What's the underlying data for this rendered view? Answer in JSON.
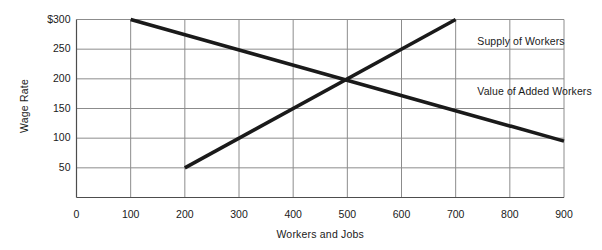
{
  "chart_data": {
    "type": "line",
    "title": "",
    "xlabel": "Workers and Jobs",
    "ylabel": "Wage Rate",
    "xlim": [
      0,
      900
    ],
    "ylim": [
      0,
      300
    ],
    "grid": true,
    "legend_position": "inline-right",
    "x_ticks": [
      0,
      100,
      200,
      300,
      400,
      500,
      600,
      700,
      800,
      900
    ],
    "x_tick_labels": [
      "0",
      "100",
      "200",
      "300",
      "400",
      "500",
      "600",
      "700",
      "800",
      "900"
    ],
    "y_ticks": [
      50,
      100,
      150,
      200,
      250,
      300
    ],
    "y_tick_labels": [
      "50",
      "100",
      "150",
      "200",
      "250",
      "$300"
    ],
    "series": [
      {
        "name": "Supply of Workers",
        "points": [
          [
            200,
            50
          ],
          [
            700,
            300
          ]
        ],
        "color": "#1a1a1a",
        "width": 3.6
      },
      {
        "name": "Value of Added Workers",
        "points": [
          [
            100,
            300
          ],
          [
            900,
            95
          ]
        ],
        "color": "#1a1a1a",
        "width": 3.6
      }
    ],
    "annotations": [
      {
        "text": "Supply of Workers",
        "x": 740,
        "y": 262
      },
      {
        "text": "Value of Added Workers",
        "x": 740,
        "y": 178
      }
    ],
    "equilibrium": {
      "x": 500,
      "y": 200
    },
    "grid_color": "#8c8c8c",
    "axis_color": "#4d4d4d"
  },
  "axes": {
    "y_title": "Wage Rate",
    "x_title": "Workers and Jobs"
  },
  "ticks": {
    "y": [
      {
        "label": "$300",
        "value": 300
      },
      {
        "label": "250",
        "value": 250
      },
      {
        "label": "200",
        "value": 200
      },
      {
        "label": "150",
        "value": 150
      },
      {
        "label": "100",
        "value": 100
      },
      {
        "label": "50",
        "value": 50
      }
    ],
    "x": [
      {
        "label": "0",
        "value": 0
      },
      {
        "label": "100",
        "value": 100
      },
      {
        "label": "200",
        "value": 200
      },
      {
        "label": "300",
        "value": 300
      },
      {
        "label": "400",
        "value": 400
      },
      {
        "label": "500",
        "value": 500
      },
      {
        "label": "600",
        "value": 600
      },
      {
        "label": "700",
        "value": 700
      },
      {
        "label": "800",
        "value": 800
      },
      {
        "label": "900",
        "value": 900
      }
    ]
  },
  "series_labels": {
    "supply": "Supply of Workers",
    "value_added": "Value of Added Workers"
  }
}
